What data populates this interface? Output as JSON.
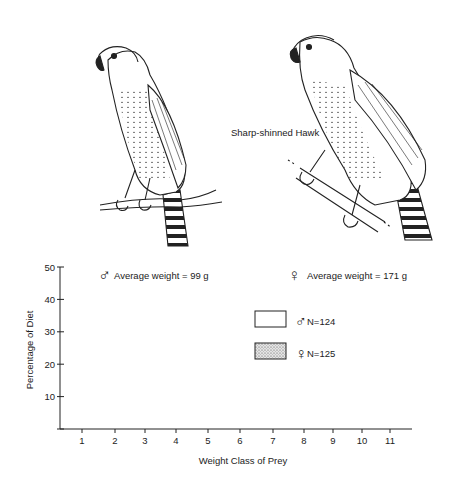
{
  "figure": {
    "species_label": "Sharp-shinned Hawk",
    "male_caption": "Average weight = 99 g",
    "female_caption": "Average weight = 171 g",
    "male_symbol": "♂",
    "female_symbol": "♀"
  },
  "legend": {
    "male": {
      "symbol": "♂",
      "label": "N=124"
    },
    "female": {
      "symbol": "♀",
      "label": "N=125"
    }
  },
  "colors": {
    "ink": "#222222",
    "stipple": "#bdbdbd",
    "background": "#ffffff"
  },
  "chart_data": {
    "type": "bar",
    "title": "",
    "xlabel": "Weight Class of Prey",
    "ylabel": "Percentage of Diet",
    "ylim": [
      0,
      50
    ],
    "yticks": [
      10,
      20,
      30,
      40,
      50
    ],
    "categories": [
      "1",
      "2",
      "3",
      "4",
      "5",
      "6",
      "7",
      "8",
      "9",
      "10",
      "11"
    ],
    "series": [
      {
        "name": "♂ N=124",
        "style": "open",
        "values": [
          11,
          34,
          40,
          11,
          1,
          3.5,
          0.5,
          0,
          0,
          0,
          0
        ]
      },
      {
        "name": "♀ N=125",
        "style": "stippled",
        "values": [
          2.5,
          23,
          37.5,
          23,
          2,
          8,
          4,
          0,
          0,
          0,
          1
        ]
      }
    ],
    "grid": false,
    "legend_position": "upper right"
  }
}
